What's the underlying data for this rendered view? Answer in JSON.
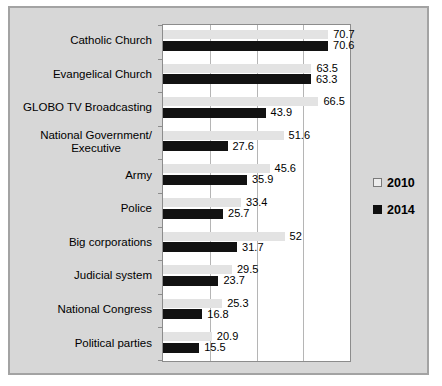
{
  "chart_data": {
    "type": "bar",
    "orientation": "horizontal",
    "title": "",
    "xlabel": "",
    "ylabel": "",
    "xlim": [
      0,
      80
    ],
    "gridline_values": [
      20,
      40,
      60,
      80
    ],
    "grid": true,
    "legend_position": "right",
    "data_labels": "outside-end",
    "categories": [
      "Catholic Church",
      "Evangelical Church",
      "GLOBO TV Broadcasting",
      "National Government/\nExecutive",
      "Army",
      "Police",
      "Big corporations",
      "Judicial system",
      "National Congress",
      "Political parties"
    ],
    "series": [
      {
        "name": "2010",
        "color": "#e3e3e3",
        "values": [
          70.7,
          63.5,
          66.5,
          51.6,
          45.6,
          33.4,
          52,
          29.5,
          25.3,
          20.9
        ]
      },
      {
        "name": "2014",
        "color": "#121212",
        "values": [
          70.6,
          63.3,
          43.9,
          27.6,
          35.9,
          25.7,
          31.7,
          23.7,
          16.8,
          15.5
        ]
      }
    ]
  },
  "colors": {
    "chart_background": "#d7d7d7",
    "chart_border": "#a3a3a3",
    "plot_background": "#ffffff",
    "plot_border": "#8c8c8c",
    "gridline": "#b5b5b5",
    "text": "#000000"
  }
}
